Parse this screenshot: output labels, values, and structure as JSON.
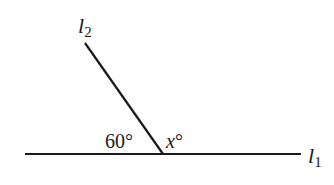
{
  "diagram": {
    "lines": [
      {
        "name": "l1",
        "label": "l",
        "subscript": "1"
      },
      {
        "name": "l2",
        "label": "l",
        "subscript": "2"
      }
    ],
    "angles": {
      "left_angle": "60°",
      "right_angle_var": "x",
      "right_angle_deg": "°"
    },
    "stroke_color": "#1a1a1a"
  }
}
